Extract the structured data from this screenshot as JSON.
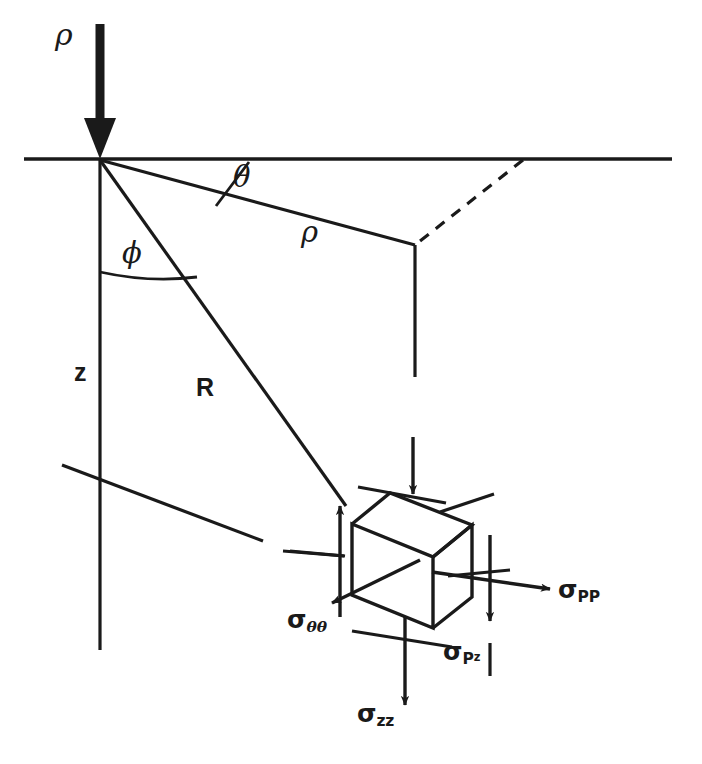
{
  "figure": {
    "stroke_color": "#1a1a1a",
    "background_color": "#ffffff"
  },
  "labels": {
    "load": "ρ",
    "theta": "θ",
    "radial": "ρ",
    "phi": "ϕ",
    "depth": "z",
    "slant": "R",
    "sigma_symbol": "σ",
    "sigma_theta_theta_sub": "θθ",
    "sigma_pp_sub": "PP",
    "sigma_pz_sub_p": "P",
    "sigma_pz_sub_z": "z",
    "sigma_zz_sub": "zz"
  },
  "geometry": {
    "surface_line": {
      "x1": 24,
      "y1": 159,
      "x2": 672,
      "y2": 159
    },
    "origin": {
      "x": 100,
      "y": 160
    },
    "load_arrow": {
      "x": 100,
      "y_top": 24,
      "y_tip": 158
    },
    "rho_line": {
      "x1": 100,
      "y1": 160,
      "x2": 415,
      "y2": 245
    },
    "R_line": {
      "x1": 100,
      "y1": 160,
      "x2": 345,
      "y2": 505
    },
    "z_line": {
      "x": 100,
      "y1": 160,
      "x2": 100,
      "y2": 650
    },
    "theta_tick": {
      "x1": 248,
      "y1": 163,
      "x2": 218,
      "y2": 204
    },
    "phi_arc": {
      "x1": 100,
      "y1": 272,
      "x2": 196,
      "y2": 276
    },
    "dashed_line": {
      "x1": 523,
      "y1": 160,
      "x2": 415,
      "y2": 245
    },
    "drop_line_upper": {
      "x": 415,
      "y1": 245,
      "y2": 375
    },
    "drop_line_lower": {
      "x": 413,
      "y1": 435,
      "y2": 495
    },
    "cube": {
      "front_top_left": {
        "x": 352,
        "y": 524
      },
      "front_top_right": {
        "x": 433,
        "y": 557
      },
      "front_bottom_right": {
        "x": 433,
        "y": 628
      },
      "front_bottom_left": {
        "x": 352,
        "y": 595
      },
      "back_top_left": {
        "x": 390,
        "y": 493
      },
      "back_top_right": {
        "x": 472,
        "y": 525
      },
      "back_bottom_right": {
        "x": 472,
        "y": 597
      }
    },
    "arrows": {
      "top_down": {
        "x": 413,
        "y1": 435,
        "y2": 497
      },
      "left_up": {
        "x": 340,
        "y1": 617,
        "y2": 503
      },
      "right_down": {
        "x": 490,
        "y1": 535,
        "y2": 623
      },
      "sigma_pp_right": {
        "x1": 430,
        "y1": 572,
        "x2": 552,
        "y2": 589
      },
      "sigma_tt_down_left": {
        "x1": 420,
        "y1": 560,
        "x2": 330,
        "y2": 604
      },
      "sigma_zz_down": {
        "x": 405,
        "y1": 617,
        "y2": 707
      }
    },
    "leader_ticks": [
      {
        "x1": 62,
        "y1": 465,
        "x2": 262,
        "y2": 540
      },
      {
        "x1": 283,
        "y1": 551,
        "x2": 343,
        "y2": 556
      },
      {
        "x1": 358,
        "y1": 487,
        "x2": 446,
        "y2": 503
      },
      {
        "x1": 440,
        "y1": 512,
        "x2": 492,
        "y2": 495
      },
      {
        "x1": 340,
        "y1": 568,
        "x2": 400,
        "y2": 542
      },
      {
        "x1": 448,
        "y1": 575,
        "x2": 508,
        "y2": 570
      },
      {
        "x1": 352,
        "y1": 630,
        "x2": 450,
        "y2": 646
      },
      {
        "x1": 490,
        "y1": 643,
        "x2": 490,
        "y2": 675
      }
    ]
  }
}
